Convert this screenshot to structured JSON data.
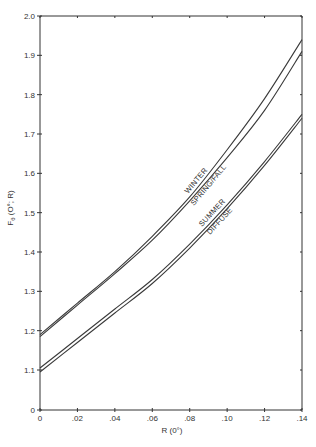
{
  "chart_data": {
    "type": "line",
    "title": "",
    "xlabel": "R (0°)",
    "ylabel": "Fθ (O°; R)",
    "xlim": [
      0,
      0.14
    ],
    "ylim": [
      1.1,
      2.0
    ],
    "y_axis_break": true,
    "y_axis_bottom_label": "0",
    "grid": false,
    "legend": "inline labels on curves",
    "x_ticks": [
      "0",
      ".02",
      ".04",
      ".06",
      ".08",
      ".10",
      ".12",
      ".14"
    ],
    "x_tick_values": [
      0,
      0.02,
      0.04,
      0.06,
      0.08,
      0.1,
      0.12,
      0.14
    ],
    "y_ticks": [
      "2.0",
      "1.9",
      "1.8",
      "1.7",
      "1.6",
      "1.5",
      "1.4",
      "1.3",
      "1.2",
      "1.1",
      "0"
    ],
    "x": [
      0,
      0.02,
      0.04,
      0.06,
      0.08,
      0.1,
      0.12,
      0.14
    ],
    "series": [
      {
        "name": "WINTER",
        "values": [
          1.19,
          1.27,
          1.35,
          1.44,
          1.54,
          1.66,
          1.79,
          1.94
        ]
      },
      {
        "name": "SPRING/FALL",
        "values": [
          1.185,
          1.265,
          1.345,
          1.43,
          1.53,
          1.64,
          1.76,
          1.91
        ]
      },
      {
        "name": "SUMMER",
        "values": [
          1.105,
          1.18,
          1.255,
          1.33,
          1.42,
          1.52,
          1.63,
          1.75
        ]
      },
      {
        "name": "DIFFUSE",
        "values": [
          1.095,
          1.17,
          1.245,
          1.32,
          1.41,
          1.51,
          1.62,
          1.74
        ]
      }
    ]
  },
  "labels": {
    "xlabel": "R (0°)",
    "ylabel_main": "F",
    "ylabel_sub": "θ",
    "ylabel_rest": " (O°; R)",
    "winter": "WINTER",
    "spring_fall": "SPRING/FALL",
    "summer": "SUMMER",
    "diffuse": "DIFFUSE"
  },
  "style": {
    "line_color": "#3a3a3a",
    "axis_color": "#333333"
  }
}
